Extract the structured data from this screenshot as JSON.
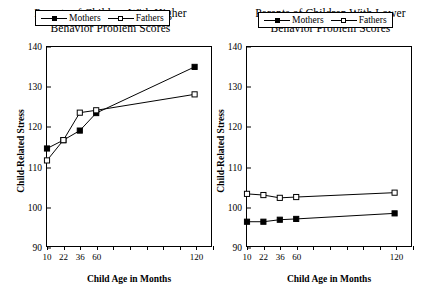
{
  "chart_data": [
    {
      "type": "line",
      "panel": "left",
      "title": "Parents of Children With Higher Behavior Problem Scores",
      "title_lines": [
        "Parents of Children With Higher",
        "Behavior Problem Scores"
      ],
      "xlabel": "Child Age in Months",
      "ylabel": "Child-Related Stress",
      "categories": [
        "10",
        "22",
        "36",
        "60",
        "120"
      ],
      "x": [
        10,
        22,
        36,
        60,
        120
      ],
      "xtick_labels": [
        "10",
        "22",
        "36",
        "60",
        "120"
      ],
      "xtick_positions": [
        0,
        1,
        2,
        3,
        9
      ],
      "xtick_count": 10,
      "ytick_labels": [
        "90",
        "100",
        "110",
        "120",
        "130",
        "140"
      ],
      "ylim": [
        90,
        140
      ],
      "ytick_step": 10,
      "grid": false,
      "legend_position": "top-center-inside",
      "series": [
        {
          "name": "Mothers",
          "marker": "filled-square",
          "values": [
            114.5,
            116.6,
            119.0,
            123.4,
            135.0
          ]
        },
        {
          "name": "Fathers",
          "marker": "open-square",
          "values": [
            111.5,
            116.6,
            123.5,
            124.1,
            128.1
          ]
        }
      ]
    },
    {
      "type": "line",
      "panel": "right",
      "title": "Parents of Children With Lower Behavior Problem Scores",
      "title_lines": [
        "Parents of Children With Lower",
        "Behavior Problem Scores"
      ],
      "xlabel": "Child Age in Months",
      "ylabel": "Child-Related Stress",
      "categories": [
        "10",
        "22",
        "36",
        "60",
        "120"
      ],
      "x": [
        10,
        22,
        36,
        60,
        120
      ],
      "xtick_labels": [
        "10",
        "22",
        "36",
        "60",
        "120"
      ],
      "xtick_positions": [
        0,
        1,
        2,
        3,
        9
      ],
      "xtick_count": 10,
      "ytick_labels": [
        "90",
        "100",
        "110",
        "120",
        "130",
        "140"
      ],
      "ylim": [
        90,
        140
      ],
      "ytick_step": 10,
      "grid": false,
      "legend_position": "top-center-inside",
      "series": [
        {
          "name": "Mothers",
          "marker": "filled-square",
          "values": [
            96.1,
            96.1,
            96.6,
            96.8,
            98.2
          ]
        },
        {
          "name": "Fathers",
          "marker": "open-square",
          "values": [
            103.1,
            102.8,
            102.1,
            102.3,
            103.4
          ]
        }
      ]
    }
  ],
  "colors": {
    "ink": "#000000",
    "background": "#ffffff"
  }
}
